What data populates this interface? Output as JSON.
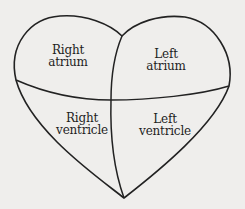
{
  "diagram": {
    "colors": {
      "background": "#efeeec",
      "stroke": "#222222",
      "text": "#1e1e1e"
    },
    "chambers": [
      {
        "id": "right-atrium",
        "line1": "Right",
        "line2": "atrium"
      },
      {
        "id": "left-atrium",
        "line1": "Left",
        "line2": "atrium"
      },
      {
        "id": "right-ventricle",
        "line1": "Right",
        "line2": "ventricle"
      },
      {
        "id": "left-ventricle",
        "line1": "Left",
        "line2": "ventricle"
      }
    ]
  }
}
